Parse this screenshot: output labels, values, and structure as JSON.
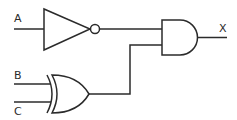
{
  "diagram": {
    "type": "logic-circuit",
    "inputs": [
      {
        "id": "A",
        "label": "A"
      },
      {
        "id": "B",
        "label": "B"
      },
      {
        "id": "C",
        "label": "C"
      }
    ],
    "outputs": [
      {
        "id": "X",
        "label": "X"
      }
    ],
    "gates": [
      {
        "id": "g1",
        "type": "NOT",
        "inputs": [
          "A"
        ]
      },
      {
        "id": "g2",
        "type": "XOR",
        "inputs": [
          "B",
          "C"
        ]
      },
      {
        "id": "g3",
        "type": "AND",
        "inputs": [
          "g1",
          "g2"
        ],
        "output": "X"
      }
    ],
    "colors": {
      "stroke": "#2b2b2b",
      "background": "#ffffff"
    }
  }
}
